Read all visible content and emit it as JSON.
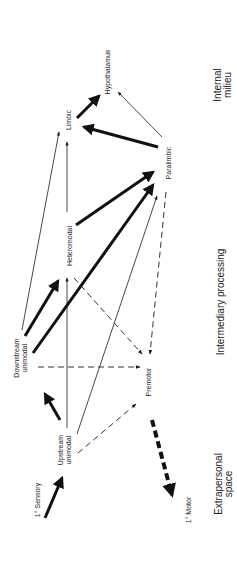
{
  "diagram": {
    "nodes": {
      "hypothalamus": "Hypothalamus",
      "limbic": "Limbic",
      "paralimbic": "Paralimbic",
      "heteromodal": "Heteromodal",
      "downstream_line1": "Downstream",
      "downstream_line2": "unimodal",
      "premotor": "Premotor",
      "upstream_line1": "Upstream",
      "upstream_line2": "unimodal",
      "primary_sensory": "1° Sensory",
      "primary_motor": "1° Motor"
    },
    "zones": {
      "internal_line1": "Internal",
      "internal_line2": "milieu",
      "intermediary": "Intermediary processing",
      "extrapersonal_line1": "Extrapersonal",
      "extrapersonal_line2": "space"
    },
    "edges": [
      {
        "from": "1° Sensory",
        "to": "Upstream unimodal",
        "style": "thick"
      },
      {
        "from": "Upstream unimodal",
        "to": "Downstream unimodal",
        "style": "thick"
      },
      {
        "from": "Upstream unimodal",
        "to": "Heteromodal",
        "style": "thin"
      },
      {
        "from": "Upstream unimodal",
        "to": "Paralimbic",
        "style": "thin"
      },
      {
        "from": "Upstream unimodal",
        "to": "Premotor",
        "style": "dashed"
      },
      {
        "from": "Downstream unimodal",
        "to": "Heteromodal",
        "style": "thick"
      },
      {
        "from": "Downstream unimodal",
        "to": "Paralimbic",
        "style": "thick"
      },
      {
        "from": "Downstream unimodal",
        "to": "Limbic",
        "style": "thin"
      },
      {
        "from": "Downstream unimodal",
        "to": "Premotor",
        "style": "dashed"
      },
      {
        "from": "Heteromodal",
        "to": "Paralimbic",
        "style": "thick"
      },
      {
        "from": "Heteromodal",
        "to": "Limbic",
        "style": "thin"
      },
      {
        "from": "Heteromodal",
        "to": "Premotor",
        "style": "dashed"
      },
      {
        "from": "Paralimbic",
        "to": "Premotor",
        "style": "dashed"
      },
      {
        "from": "Paralimbic",
        "to": "Limbic",
        "style": "thick"
      },
      {
        "from": "Paralimbic",
        "to": "Hypothalamus",
        "style": "thin"
      },
      {
        "from": "Limbic",
        "to": "Hypothalamus",
        "style": "thick"
      },
      {
        "from": "Premotor",
        "to": "1° Motor",
        "style": "thick-dashed"
      }
    ]
  }
}
